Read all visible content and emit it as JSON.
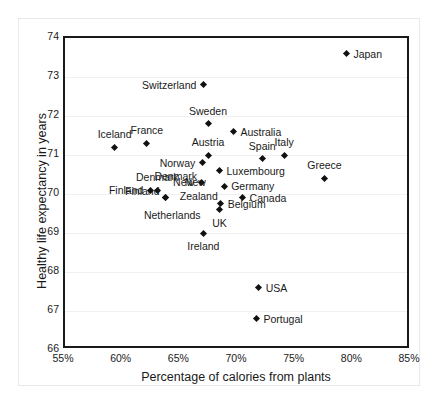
{
  "chart_data": {
    "type": "scatter",
    "title": "",
    "xlabel": "Percentage of calories from plants",
    "ylabel": "Healthy life expectancy in years",
    "xlim": [
      55,
      85
    ],
    "ylim": [
      66,
      74
    ],
    "xticks": [
      "55%",
      "60%",
      "65%",
      "70%",
      "75%",
      "80%",
      "85%"
    ],
    "xtick_values": [
      55,
      60,
      65,
      70,
      75,
      80,
      85
    ],
    "yticks": [
      "66",
      "67",
      "68",
      "69",
      "70",
      "71",
      "72",
      "73",
      "74"
    ],
    "ytick_values": [
      66,
      67,
      68,
      69,
      70,
      71,
      72,
      73,
      74
    ],
    "grid": true,
    "legend": "none",
    "marker": "diamond",
    "marker_color": "#111111",
    "points": [
      {
        "label": "Japan",
        "x": 79.4,
        "y": 73.6,
        "label_pos": "l"
      },
      {
        "label": "Switzerland",
        "x": 67.0,
        "y": 72.8,
        "label_pos": "r"
      },
      {
        "label": "Sweden",
        "x": 67.4,
        "y": 71.8,
        "label_pos": "top"
      },
      {
        "label": "Australia",
        "x": 69.6,
        "y": 71.6,
        "label_pos": "l"
      },
      {
        "label": "Iceland",
        "x": 59.3,
        "y": 71.2,
        "label_pos": "top"
      },
      {
        "label": "France",
        "x": 62.1,
        "y": 71.3,
        "label_pos": "top"
      },
      {
        "label": "Austria",
        "x": 67.4,
        "y": 71.0,
        "label_pos": "top"
      },
      {
        "label": "Spain",
        "x": 72.1,
        "y": 70.9,
        "label_pos": "top"
      },
      {
        "label": "Italy",
        "x": 74.0,
        "y": 71.0,
        "label_pos": "top"
      },
      {
        "label": "Norway",
        "x": 66.9,
        "y": 70.8,
        "label_pos": "r"
      },
      {
        "label": "Luxembourg",
        "x": 68.4,
        "y": 70.6,
        "label_pos": "l"
      },
      {
        "label": "Greece",
        "x": 77.5,
        "y": 70.4,
        "label_pos": "top"
      },
      {
        "label": "Denmark",
        "x": 63.0,
        "y": 70.1,
        "label_pos": "top"
      },
      {
        "label": "Germany",
        "x": 68.8,
        "y": 70.2,
        "label_pos": "l"
      },
      {
        "label": "Finland",
        "x": 62.4,
        "y": 70.1,
        "label_pos": "r"
      },
      {
        "label": "New",
        "x": 66.8,
        "y": 70.3,
        "label_pos": "r"
      },
      {
        "label": "Zealand",
        "x": 63.7,
        "y": 69.9,
        "label_pos": "none"
      },
      {
        "label": "Canada",
        "x": 70.4,
        "y": 69.9,
        "label_pos": "l"
      },
      {
        "label": "Netherlands",
        "x": 63.7,
        "y": 69.9,
        "label_pos": "none2"
      },
      {
        "label": "Belgium",
        "x": 68.5,
        "y": 69.75,
        "label_pos": "l"
      },
      {
        "label": "UK",
        "x": 68.4,
        "y": 69.6,
        "label_pos": "bot"
      },
      {
        "label": "Ireland",
        "x": 67.0,
        "y": 69.0,
        "label_pos": "bot"
      },
      {
        "label": "USA",
        "x": 71.8,
        "y": 67.6,
        "label_pos": "l"
      },
      {
        "label": "Portugal",
        "x": 71.6,
        "y": 66.8,
        "label_pos": "l"
      }
    ],
    "text_annotations": [
      {
        "text": "Zealand",
        "x": 66.6,
        "y": 69.95
      },
      {
        "text": "Netherlands",
        "x": 64.3,
        "y": 69.45
      },
      {
        "text": "Denmark",
        "x": 64.6,
        "y": 70.45
      },
      {
        "text": "Finland",
        "x": 61.7,
        "y": 70.08
      },
      {
        "text": "New",
        "x": 66.3,
        "y": 70.3
      }
    ]
  }
}
